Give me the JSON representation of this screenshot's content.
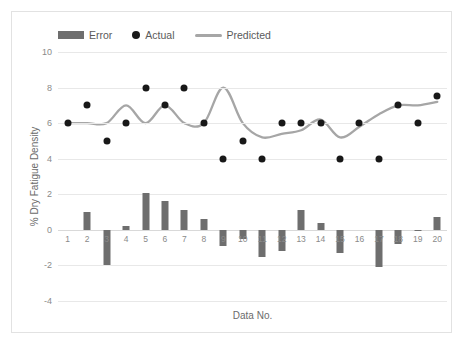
{
  "legend": [
    {
      "name": "error",
      "label": "Error",
      "marker": "bar-swatch",
      "color": "#6e6e6e"
    },
    {
      "name": "actual",
      "label": "Actual",
      "marker": "dot-swatch",
      "color": "#181818"
    },
    {
      "name": "predicted",
      "label": "Predicted",
      "marker": "line-swatch",
      "color": "#a6a6a6"
    }
  ],
  "chart_data": {
    "type": "bar",
    "title": "",
    "xlabel": "Data No.",
    "ylabel": "% Dry Fatigue Density",
    "ylim": [
      -4,
      10
    ],
    "yticks": [
      10,
      8,
      6,
      4,
      2,
      0,
      -2,
      -4
    ],
    "ytick_labels": [
      "10",
      "8",
      "6",
      "4",
      "2",
      "0",
      "-2",
      "-4"
    ],
    "grid": true,
    "legend_position": "top-left",
    "categories": [
      1,
      2,
      3,
      4,
      5,
      6,
      7,
      8,
      9,
      10,
      11,
      12,
      13,
      14,
      15,
      16,
      17,
      18,
      19,
      20
    ],
    "xtick_labels": [
      "1",
      "2",
      "3",
      "4",
      "5",
      "6",
      "7",
      "8",
      "9",
      "10",
      "11",
      "12",
      "13",
      "14",
      "15",
      "16",
      "17",
      "18",
      "19",
      "20"
    ],
    "series": [
      {
        "name": "Error",
        "type": "bar",
        "color": "#6e6e6e",
        "values": [
          0,
          1.0,
          -2.0,
          0.2,
          2.1,
          1.6,
          1.1,
          0.6,
          -0.9,
          -0.5,
          -1.5,
          -1.2,
          1.1,
          0.4,
          -1.3,
          0,
          -2.1,
          -0.8,
          -0.05,
          0.7
        ]
      },
      {
        "name": "Actual",
        "type": "scatter",
        "color": "#181818",
        "values": [
          6,
          7,
          5,
          6,
          8,
          7,
          8,
          6,
          4,
          5,
          4,
          6,
          6,
          6,
          4,
          6,
          4,
          7,
          6,
          7.5
        ]
      },
      {
        "name": "Predicted",
        "type": "line",
        "color": "#a6a6a6",
        "values": [
          6,
          6,
          6,
          7,
          6,
          7,
          6,
          6,
          8,
          6,
          5.2,
          5.4,
          5.6,
          6.2,
          5.2,
          5.8,
          6.5,
          7,
          7,
          7.2
        ]
      }
    ]
  }
}
